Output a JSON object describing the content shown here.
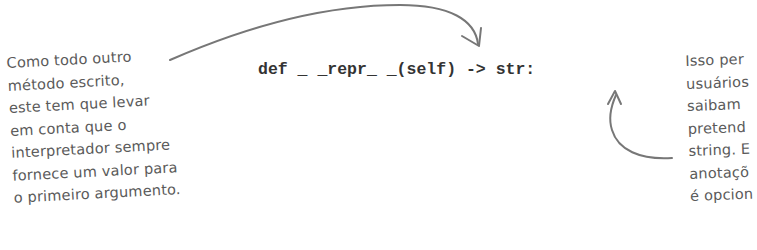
{
  "code_line": {
    "text": "def _ _repr_ _(self) -> str:"
  },
  "left_annotation": {
    "lines": [
      "Como todo outro",
      "método escrito,",
      "este tem que levar",
      "em conta que o",
      "interpretador sempre",
      "fornece um valor para",
      "o primeiro argumento."
    ]
  },
  "right_annotation": {
    "lines": [
      "Isso per",
      "usuários",
      "saibam",
      "pretend",
      "string. E",
      "anotaçõ",
      "é opcion"
    ]
  },
  "colors": {
    "annotation_text": "#5a5a5a",
    "arrow": "#777777",
    "code_text": "#333333",
    "background": "#ffffff"
  }
}
